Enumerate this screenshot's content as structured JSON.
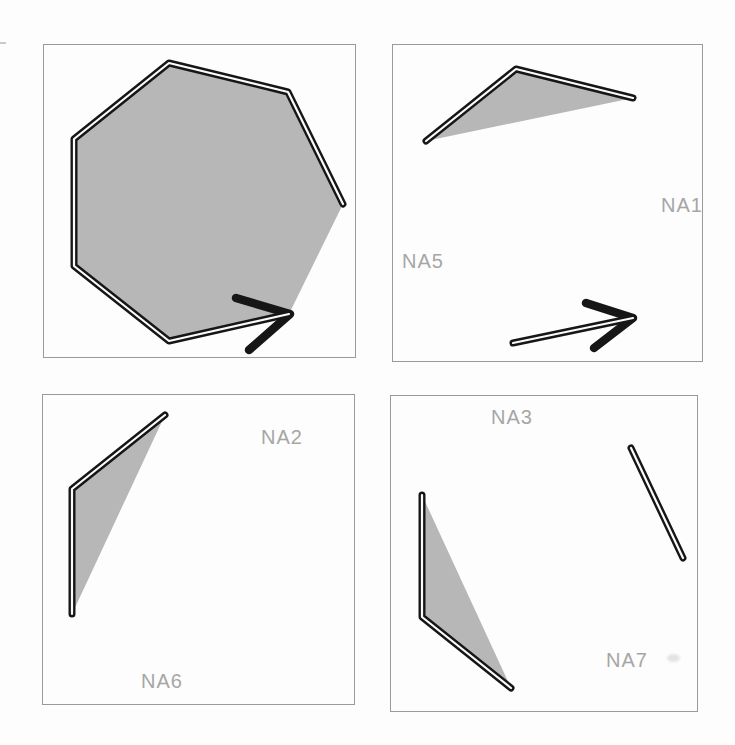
{
  "figure": {
    "colors": {
      "background": "#fdfdfd",
      "panel_border": "#9a9a9a",
      "shape_fill": "#b7b7b7",
      "line": "#161616",
      "line_core": "#fbfbfb",
      "label_text": "#a6a6a6"
    },
    "style": {
      "track_width": 7,
      "core_width": 2.2,
      "chevron_width": 8.5
    }
  },
  "labels": {
    "na1": "NA1",
    "na5": "NA5",
    "na2": "NA2",
    "na6": "NA6",
    "na3": "NA3",
    "na7": "NA7"
  },
  "panels": [
    {
      "name": "top-left",
      "frame": {
        "x": 43,
        "y": 44,
        "w": 313,
        "h": 314
      },
      "fills": [
        [
          [
            299,
            159
          ],
          [
            244,
            47
          ],
          [
            125,
            18
          ],
          [
            30,
            94
          ],
          [
            30,
            221
          ],
          [
            125,
            296
          ],
          [
            245,
            269
          ]
        ]
      ],
      "tracks": [
        [
          [
            299,
            159
          ],
          [
            244,
            47
          ],
          [
            125,
            18
          ],
          [
            30,
            94
          ],
          [
            30,
            221
          ],
          [
            125,
            296
          ],
          [
            245,
            269
          ]
        ]
      ],
      "chevrons": [
        [
          [
            192,
            253
          ],
          [
            246,
            269
          ],
          [
            205,
            305
          ]
        ]
      ]
    },
    {
      "name": "top-right",
      "frame": {
        "x": 392,
        "y": 44,
        "w": 311,
        "h": 318
      },
      "fills": [
        [
          [
            33,
            96
          ],
          [
            123,
            24
          ],
          [
            240,
            53
          ]
        ]
      ],
      "tracks": [
        [
          [
            33,
            96
          ],
          [
            123,
            24
          ],
          [
            240,
            53
          ]
        ],
        [
          [
            120,
            298
          ],
          [
            240,
            273
          ]
        ]
      ],
      "chevrons": [
        [
          [
            193,
            258
          ],
          [
            240,
            273
          ],
          [
            201,
            303
          ]
        ]
      ]
    },
    {
      "name": "bottom-left",
      "frame": {
        "x": 42,
        "y": 394,
        "w": 313,
        "h": 311
      },
      "fills": [
        [
          [
            122,
            20
          ],
          [
            29,
            94
          ],
          [
            29,
            219
          ]
        ]
      ],
      "tracks": [
        [
          [
            122,
            20
          ],
          [
            29,
            94
          ],
          [
            29,
            219
          ]
        ]
      ],
      "chevrons": []
    },
    {
      "name": "bottom-right",
      "frame": {
        "x": 390,
        "y": 395,
        "w": 308,
        "h": 317
      },
      "fills": [
        [
          [
            31,
            99
          ],
          [
            31,
            221
          ],
          [
            120,
            292
          ]
        ]
      ],
      "tracks": [
        [
          [
            31,
            99
          ],
          [
            31,
            221
          ],
          [
            120,
            292
          ]
        ],
        [
          [
            240,
            52
          ],
          [
            292,
            162
          ]
        ]
      ],
      "chevrons": []
    }
  ]
}
